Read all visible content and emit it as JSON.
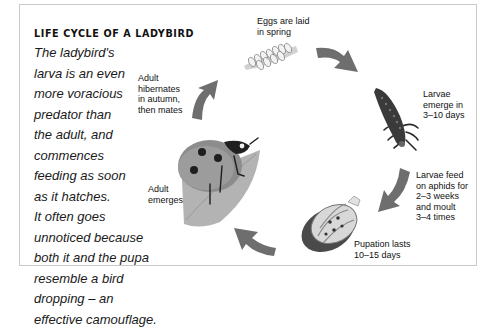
{
  "diagram": {
    "title": "LIFE CYCLE OF A LADYBIRD",
    "description_lines": [
      "The ladybird's",
      "larva is an even",
      "more voracious",
      "predator than",
      "the adult, and",
      "commences",
      "feeding as soon",
      "as it hatches.",
      "It often goes",
      "unnoticed because",
      "both it and the pupa",
      "resemble a bird",
      "dropping – an",
      "effective camouflage."
    ],
    "stages": [
      {
        "id": "eggs",
        "label_lines": [
          "Eggs are laid",
          "in spring"
        ],
        "icon": "eggs-cluster-icon"
      },
      {
        "id": "larvae-emerge",
        "label_lines": [
          "Larvae",
          "emerge in",
          "3–10 days"
        ],
        "icon": "larva-icon"
      },
      {
        "id": "larvae-feed",
        "label_lines": [
          "Larvae feed",
          "on aphids for",
          "2–3 weeks",
          "and moult",
          "3–4 times"
        ],
        "icon": "arrow-icon"
      },
      {
        "id": "pupation",
        "label_lines": [
          "Pupation lasts",
          "10–15 days"
        ],
        "icon": "pupa-icon"
      },
      {
        "id": "adult-emerges",
        "label_lines": [
          "Adult",
          "emerges"
        ],
        "icon": "ladybird-on-leaf-icon"
      },
      {
        "id": "hibernates",
        "label_lines": [
          "Adult",
          "hibernates",
          "in autumn,",
          "then mates"
        ],
        "icon": "arrow-icon"
      }
    ],
    "colors": {
      "border": "#c8c8c8",
      "arrow": "#6e6e6e",
      "text": "#111111"
    }
  }
}
